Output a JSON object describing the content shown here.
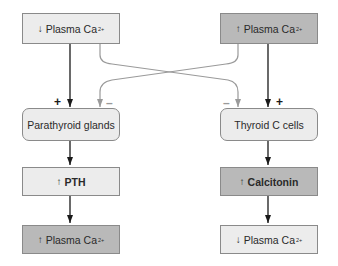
{
  "diagram": {
    "left_column": {
      "stimulus": {
        "arrow": "↓",
        "label": "Plasma Ca",
        "superscript": "2+"
      },
      "organ": {
        "label": "Parathyroid glands"
      },
      "hormone": {
        "arrow": "↑",
        "label": "PTH"
      },
      "result": {
        "arrow": "↑",
        "label": "Plasma Ca",
        "superscript": "2+"
      }
    },
    "right_column": {
      "stimulus": {
        "arrow": "↑",
        "label": "Plasma Ca",
        "superscript": "2+"
      },
      "organ": {
        "label": "Thyroid C cells"
      },
      "hormone": {
        "arrow": "↑",
        "label": "Calcitonin"
      },
      "result": {
        "arrow": "↓",
        "label": "Plasma Ca",
        "superscript": "2+"
      }
    },
    "signs": {
      "plus": "+",
      "minus": "–"
    },
    "colors": {
      "light_box": "#ececec",
      "dark_box": "#b9b9b9",
      "border": "#8a8a8a",
      "stimulatory_arrow": "#1a1a1a",
      "inhibitory_arrow": "#9a9a9a"
    }
  }
}
